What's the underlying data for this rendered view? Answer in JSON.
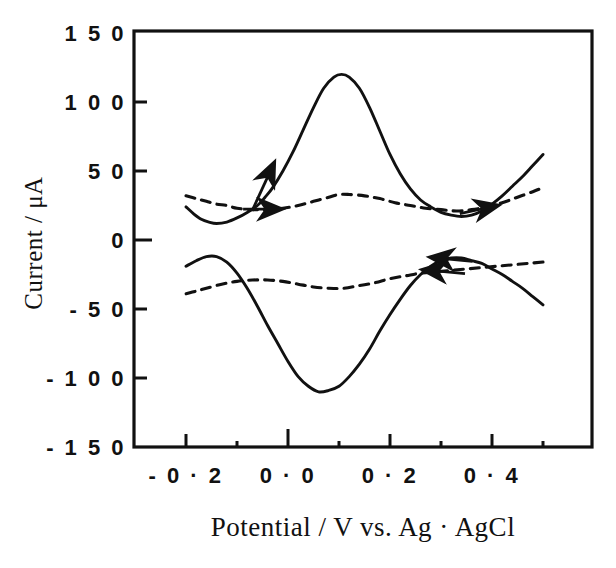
{
  "figure": {
    "background_color": "#ffffff",
    "ink_color": "#111111",
    "width": 616,
    "height": 568
  },
  "chart_data": {
    "type": "line",
    "title": "",
    "subtitle": "",
    "xlabel": "Potential / V vs. Ag · AgCl",
    "ylabel": "Current / μA",
    "xlim": [
      -0.29,
      0.6
    ],
    "ylim": [
      -150,
      150
    ],
    "grid": false,
    "legend": "none",
    "x_ticks": [
      -0.2,
      0.0,
      0.2,
      0.4
    ],
    "x_tick_labels": [
      "- 0 · 2",
      "0 · 0",
      "0 · 2",
      "0 · 4"
    ],
    "x_minor_ticks": [
      -0.1,
      0.1,
      0.3,
      0.5
    ],
    "y_ticks": [
      150,
      100,
      50,
      0,
      -50,
      -100,
      -150
    ],
    "y_tick_labels": [
      "1 5 0",
      "1 0 0",
      "5 0",
      "0",
      "- 5 0",
      "- 1 0 0",
      "- 1 5 0"
    ],
    "series": [
      {
        "name": "solid-forward-anodic",
        "style": "solid",
        "direction": "forward (positive sweep)",
        "points": [
          [
            -0.2,
            24
          ],
          [
            -0.185,
            19
          ],
          [
            -0.17,
            15
          ],
          [
            -0.155,
            13
          ],
          [
            -0.14,
            12
          ],
          [
            -0.12,
            13
          ],
          [
            -0.1,
            16
          ],
          [
            -0.08,
            20
          ],
          [
            -0.06,
            25
          ],
          [
            -0.045,
            31
          ],
          [
            -0.03,
            38
          ],
          [
            -0.01,
            50
          ],
          [
            0.01,
            64
          ],
          [
            0.03,
            80
          ],
          [
            0.05,
            96
          ],
          [
            0.07,
            110
          ],
          [
            0.09,
            118
          ],
          [
            0.105,
            120
          ],
          [
            0.12,
            118
          ],
          [
            0.14,
            110
          ],
          [
            0.16,
            96
          ],
          [
            0.18,
            79
          ],
          [
            0.2,
            62
          ],
          [
            0.22,
            48
          ],
          [
            0.24,
            37
          ],
          [
            0.26,
            29
          ],
          [
            0.28,
            24
          ],
          [
            0.3,
            20
          ],
          [
            0.32,
            18
          ],
          [
            0.34,
            17
          ],
          [
            0.36,
            18
          ],
          [
            0.38,
            21
          ],
          [
            0.4,
            26
          ],
          [
            0.42,
            32
          ],
          [
            0.44,
            39
          ],
          [
            0.46,
            46
          ],
          [
            0.48,
            54
          ],
          [
            0.5,
            62
          ]
        ]
      },
      {
        "name": "dashed-forward-anodic",
        "style": "dashed",
        "direction": "forward (positive sweep)",
        "points": [
          [
            -0.2,
            32
          ],
          [
            -0.18,
            30
          ],
          [
            -0.16,
            28
          ],
          [
            -0.14,
            26
          ],
          [
            -0.12,
            25
          ],
          [
            -0.1,
            23
          ],
          [
            -0.07,
            22
          ],
          [
            -0.04,
            22
          ],
          [
            -0.01,
            23
          ],
          [
            0.02,
            25
          ],
          [
            0.05,
            28
          ],
          [
            0.08,
            31
          ],
          [
            0.1,
            33
          ],
          [
            0.12,
            33
          ],
          [
            0.15,
            32
          ],
          [
            0.18,
            30
          ],
          [
            0.21,
            27
          ],
          [
            0.24,
            25
          ],
          [
            0.27,
            23
          ],
          [
            0.3,
            22
          ],
          [
            0.33,
            21
          ],
          [
            0.36,
            22
          ],
          [
            0.39,
            24
          ],
          [
            0.42,
            27
          ],
          [
            0.45,
            31
          ],
          [
            0.48,
            35
          ],
          [
            0.5,
            38
          ]
        ]
      },
      {
        "name": "solid-reverse-cathodic",
        "style": "solid",
        "direction": "reverse (negative sweep)",
        "points": [
          [
            0.5,
            -47
          ],
          [
            0.48,
            -41
          ],
          [
            0.46,
            -35
          ],
          [
            0.44,
            -30
          ],
          [
            0.42,
            -25
          ],
          [
            0.4,
            -21
          ],
          [
            0.38,
            -17
          ],
          [
            0.36,
            -15
          ],
          [
            0.34,
            -13
          ],
          [
            0.32,
            -13
          ],
          [
            0.3,
            -15
          ],
          [
            0.28,
            -19
          ],
          [
            0.26,
            -25
          ],
          [
            0.24,
            -33
          ],
          [
            0.22,
            -43
          ],
          [
            0.2,
            -54
          ],
          [
            0.18,
            -66
          ],
          [
            0.16,
            -79
          ],
          [
            0.14,
            -90
          ],
          [
            0.12,
            -99
          ],
          [
            0.1,
            -106
          ],
          [
            0.08,
            -109
          ],
          [
            0.06,
            -110
          ],
          [
            0.04,
            -106
          ],
          [
            0.02,
            -99
          ],
          [
            0.0,
            -88
          ],
          [
            -0.02,
            -75
          ],
          [
            -0.04,
            -62
          ],
          [
            -0.06,
            -48
          ],
          [
            -0.08,
            -35
          ],
          [
            -0.1,
            -24
          ],
          [
            -0.12,
            -16
          ],
          [
            -0.14,
            -12
          ],
          [
            -0.16,
            -12
          ],
          [
            -0.18,
            -15
          ],
          [
            -0.2,
            -19
          ]
        ]
      },
      {
        "name": "dashed-reverse-cathodic",
        "style": "dashed",
        "direction": "reverse (negative sweep)",
        "points": [
          [
            0.5,
            -16
          ],
          [
            0.47,
            -17
          ],
          [
            0.44,
            -18
          ],
          [
            0.41,
            -19
          ],
          [
            0.38,
            -20
          ],
          [
            0.35,
            -21
          ],
          [
            0.32,
            -22
          ],
          [
            0.29,
            -23
          ],
          [
            0.26,
            -24
          ],
          [
            0.23,
            -26
          ],
          [
            0.2,
            -28
          ],
          [
            0.17,
            -31
          ],
          [
            0.14,
            -33
          ],
          [
            0.11,
            -35
          ],
          [
            0.08,
            -35
          ],
          [
            0.05,
            -34
          ],
          [
            0.02,
            -32
          ],
          [
            -0.01,
            -30
          ],
          [
            -0.04,
            -29
          ],
          [
            -0.07,
            -29
          ],
          [
            -0.1,
            -30
          ],
          [
            -0.13,
            -32
          ],
          [
            -0.16,
            -35
          ],
          [
            -0.18,
            -37
          ],
          [
            -0.2,
            -39
          ]
        ]
      }
    ],
    "annotations": [
      {
        "name": "arrow-anodic-solid-up",
        "direction": "up-right",
        "at_x": -0.045,
        "at_y": 40,
        "series": "solid-forward-anodic"
      },
      {
        "name": "arrow-anodic-dashed-right",
        "direction": "right",
        "at_x": -0.045,
        "at_y": 22,
        "series": "dashed-forward-anodic"
      },
      {
        "name": "arrow-cathodic-solid-left",
        "direction": "left",
        "at_x": 0.315,
        "at_y": -14,
        "series": "solid-reverse-cathodic"
      },
      {
        "name": "arrow-cathodic-dashed-left",
        "direction": "left",
        "at_x": 0.3,
        "at_y": -23,
        "series": "dashed-reverse-cathodic"
      },
      {
        "name": "arrow-anodic-solid-right-upper",
        "direction": "right",
        "at_x": 0.38,
        "at_y": 21,
        "series": "solid-forward-anodic"
      }
    ],
    "peaks": {
      "anodic_peak_potential_V": 0.105,
      "anodic_peak_current_uA": 120,
      "cathodic_peak_potential_V": 0.06,
      "cathodic_peak_current_uA": -110
    }
  }
}
